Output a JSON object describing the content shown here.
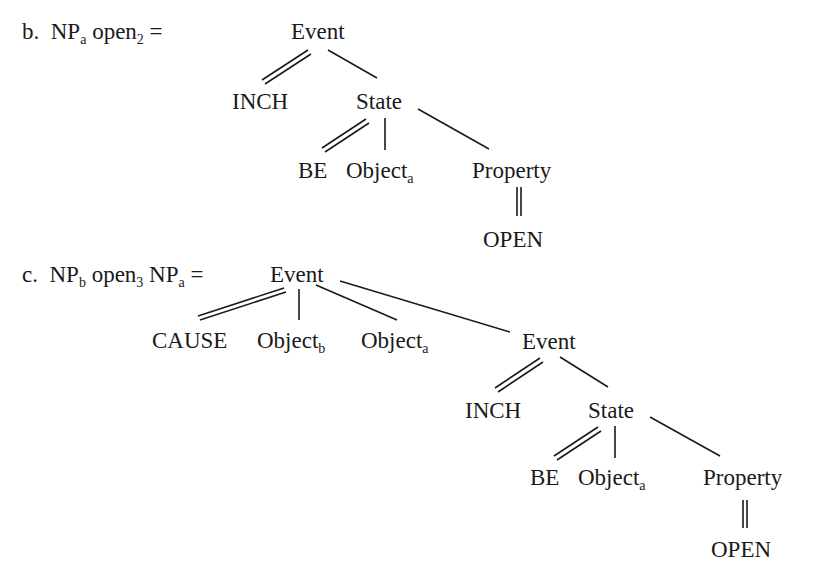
{
  "example_b": {
    "marker": "b.",
    "formula": {
      "np": "NP",
      "np_sub": "a",
      "verb": "open",
      "verb_sub": "2",
      "equals": "="
    },
    "tree": {
      "root": "Event",
      "inch": "INCH",
      "state": "State",
      "be": "BE",
      "object": "Object",
      "object_sub": "a",
      "property": "Property",
      "open": "OPEN"
    }
  },
  "example_c": {
    "marker": "c.",
    "formula": {
      "np1": "NP",
      "np1_sub": "b",
      "verb": "open",
      "verb_sub": "3",
      "np2": "NP",
      "np2_sub": "a",
      "equals": "="
    },
    "tree": {
      "root": "Event",
      "cause": "CAUSE",
      "object_b": "Object",
      "object_b_sub": "b",
      "object_a": "Object",
      "object_a_sub": "a",
      "event2": "Event",
      "inch": "INCH",
      "state": "State",
      "be": "BE",
      "object": "Object",
      "object_sub": "a",
      "property": "Property",
      "open": "OPEN"
    }
  }
}
